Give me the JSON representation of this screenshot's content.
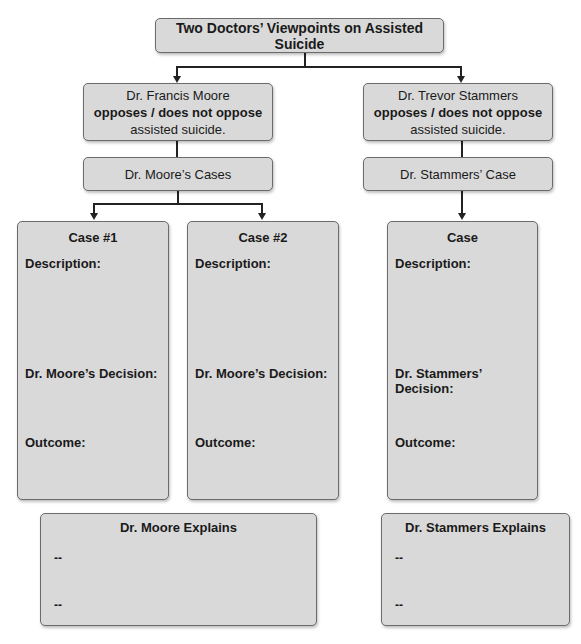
{
  "title": "Two Doctors’ Viewpoints on Assisted Suicide",
  "doctors": [
    {
      "name": "Dr. Francis Moore",
      "stance": "opposes / does not oppose",
      "tail": "assisted suicide.",
      "cases_label": "Dr. Moore’s Cases",
      "cases": [
        {
          "heading": "Case #1",
          "description_label": "Description:",
          "decision_label": "Dr. Moore’s Decision:",
          "outcome_label": "Outcome:"
        },
        {
          "heading": "Case #2",
          "description_label": "Description:",
          "decision_label": "Dr. Moore’s Decision:",
          "outcome_label": "Outcome:"
        }
      ],
      "explains": {
        "heading": "Dr. Moore Explains",
        "bullets": [
          "--",
          "--"
        ]
      }
    },
    {
      "name": "Dr. Trevor Stammers",
      "stance": "opposes / does not oppose",
      "tail": "assisted suicide.",
      "cases_label": "Dr. Stammers’ Case",
      "cases": [
        {
          "heading": "Case",
          "description_label": "Description:",
          "decision_label": "Dr. Stammers’ Decision:",
          "outcome_label": "Outcome:"
        }
      ],
      "explains": {
        "heading": "Dr. Stammers Explains",
        "bullets": [
          "--",
          "--"
        ]
      }
    }
  ],
  "colors": {
    "box_fill": "#d9d9d9",
    "box_border": "#6b6b6b",
    "connector": "#222222"
  }
}
